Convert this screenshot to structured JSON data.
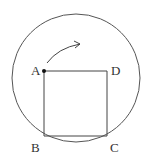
{
  "diagram": {
    "type": "geometry",
    "circle": {
      "cx": 76,
      "cy": 78,
      "r": 64,
      "stroke": "#555555"
    },
    "square": {
      "vertices": {
        "A": {
          "x": 44,
          "y": 71
        },
        "D": {
          "x": 107,
          "y": 71
        },
        "C": {
          "x": 107,
          "y": 136
        },
        "B": {
          "x": 44,
          "y": 136
        }
      },
      "stroke": "#444444"
    },
    "labels": {
      "A": {
        "text": "A",
        "x": 31,
        "y": 75
      },
      "D": {
        "text": "D",
        "x": 111,
        "y": 75
      },
      "B": {
        "text": "B",
        "x": 31,
        "y": 152
      },
      "C": {
        "text": "C",
        "x": 110,
        "y": 152
      }
    },
    "point_A_marker": {
      "x": 44,
      "y": 71,
      "r": 2
    },
    "rotation_arrow": {
      "description": "Curved arrow from near A indicating clockwise rotation",
      "path": "M 47 63 Q 58 48 80 44",
      "arrowhead_at": {
        "x": 80,
        "y": 44
      }
    }
  }
}
